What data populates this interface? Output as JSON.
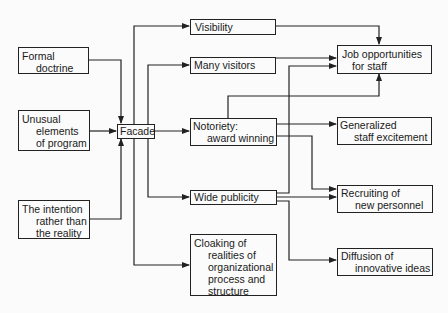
{
  "diagram": {
    "inputs": [
      {
        "id": "formal-doctrine",
        "lines": [
          "Formal",
          "doctrine"
        ]
      },
      {
        "id": "unusual-elements",
        "lines": [
          "Unusual",
          "elements",
          "of program"
        ]
      },
      {
        "id": "intention",
        "lines": [
          "The intention",
          "rather than",
          "the reality"
        ]
      }
    ],
    "center": {
      "id": "facade",
      "lines": [
        "Facade"
      ]
    },
    "middle": [
      {
        "id": "visibility",
        "lines": [
          "Visibility"
        ]
      },
      {
        "id": "many-visitors",
        "lines": [
          "Many visitors"
        ]
      },
      {
        "id": "notoriety",
        "lines": [
          "Notoriety:",
          "award winning"
        ]
      },
      {
        "id": "wide-publicity",
        "lines": [
          "Wide publicity"
        ]
      },
      {
        "id": "cloaking",
        "lines": [
          "Cloaking of",
          "realities of",
          "organizational",
          "process and",
          "structure"
        ]
      }
    ],
    "outputs": [
      {
        "id": "job-opportunities",
        "lines": [
          "Job opportunities",
          "for staff"
        ]
      },
      {
        "id": "generalized-excitement",
        "lines": [
          "Generalized",
          "staff excitement"
        ]
      },
      {
        "id": "recruiting",
        "lines": [
          "Recruiting of",
          "new personnel"
        ]
      },
      {
        "id": "diffusion",
        "lines": [
          "Diffusion of",
          "innovative ideas"
        ]
      }
    ],
    "edges": [
      [
        "formal-doctrine",
        "facade"
      ],
      [
        "unusual-elements",
        "facade"
      ],
      [
        "intention",
        "facade"
      ],
      [
        "facade",
        "visibility"
      ],
      [
        "facade",
        "many-visitors"
      ],
      [
        "facade",
        "notoriety"
      ],
      [
        "facade",
        "wide-publicity"
      ],
      [
        "facade",
        "cloaking"
      ],
      [
        "visibility",
        "job-opportunities"
      ],
      [
        "many-visitors",
        "job-opportunities"
      ],
      [
        "notoriety",
        "job-opportunities"
      ],
      [
        "notoriety",
        "generalized-excitement"
      ],
      [
        "notoriety",
        "recruiting"
      ],
      [
        "wide-publicity",
        "job-opportunities"
      ],
      [
        "wide-publicity",
        "recruiting"
      ],
      [
        "wide-publicity",
        "diffusion"
      ]
    ]
  }
}
